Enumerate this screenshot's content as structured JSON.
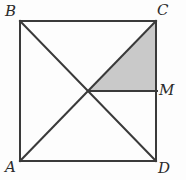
{
  "figure": {
    "width": 186,
    "height": 180,
    "background_color": "#fdfdfd",
    "stroke_color": "#3a3a3a",
    "shade_color": "#c9c9c9",
    "stroke_width": 2,
    "labels": {
      "top_left": "B",
      "top_right": "C",
      "right_mid": "M",
      "bottom_left": "A",
      "bottom_right": "D"
    },
    "points": {
      "B": {
        "x": 20,
        "y": 21
      },
      "C": {
        "x": 156,
        "y": 21
      },
      "A": {
        "x": 20,
        "y": 161
      },
      "D": {
        "x": 156,
        "y": 161
      },
      "M": {
        "x": 156,
        "y": 91
      },
      "center": {
        "x": 88,
        "y": 91
      }
    },
    "segments": [
      "B-C",
      "C-D",
      "D-A",
      "A-B",
      "B-D",
      "A-C",
      "center-M"
    ],
    "shaded_region": {
      "name": "triangle-center-C-M",
      "vertices": [
        "center",
        "C",
        "M"
      ],
      "fill": "#c9c9c9"
    }
  }
}
